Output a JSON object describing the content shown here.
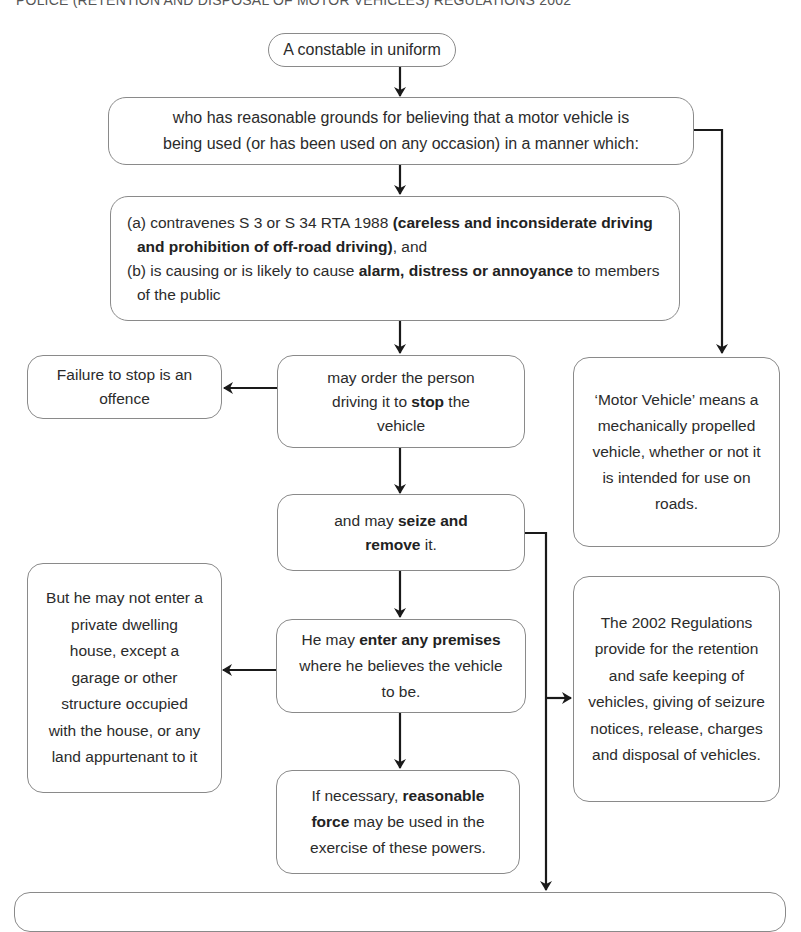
{
  "header": {
    "title": "POLICE (RETENTION AND DISPOSAL OF MOTOR VEHICLES) REGULATIONS 2002"
  },
  "nodes": {
    "constable": {
      "text": "A constable in uniform"
    },
    "grounds": {
      "line1": "who has reasonable grounds for believing that a motor vehicle is",
      "line2": "being used (or has been used on any occasion) in a manner which:"
    },
    "conditions": {
      "a_prefix": "(a) contravenes S 3 or S 34 RTA 1988 ",
      "a_bold": "(careless and inconsiderate driving and prohibition of off-road driving)",
      "a_suffix": ", and",
      "b_prefix": "(b) is causing or is likely to cause ",
      "b_bold": "alarm, distress or annoyance",
      "b_suffix": " to members of the public"
    },
    "failure": {
      "text": "Failure to stop is an offence"
    },
    "stop": {
      "prefix": "may order the person driving it to ",
      "bold": "stop",
      "suffix": " the vehicle"
    },
    "motor_vehicle_def": {
      "text": "‘Motor Vehicle’ means a mechanically propelled vehicle, whether or not it is intended for use on roads."
    },
    "seize": {
      "prefix": "and may ",
      "bold": "seize and remove",
      "suffix": " it."
    },
    "not_dwelling": {
      "text": "But he may not enter a private dwelling house, except a garage or other structure occupied with the house, or any land appurtenant to it"
    },
    "enter": {
      "prefix": "He may ",
      "bold": "enter any premises",
      "suffix": " where he believes the vehicle to be."
    },
    "regulations": {
      "text": "The 2002 Regulations provide for the retention and safe keeping of vehicles, giving of seizure notices, release, charges and disposal of vehicles."
    },
    "force": {
      "prefix": "If necessary, ",
      "bold": "reasonable force",
      "suffix": " may be used in the exercise of these powers."
    },
    "bottom": {
      "text": ""
    }
  },
  "colors": {
    "line": "#1a1a1a",
    "border": "#8a8a8a",
    "text": "#2b2b2b"
  }
}
